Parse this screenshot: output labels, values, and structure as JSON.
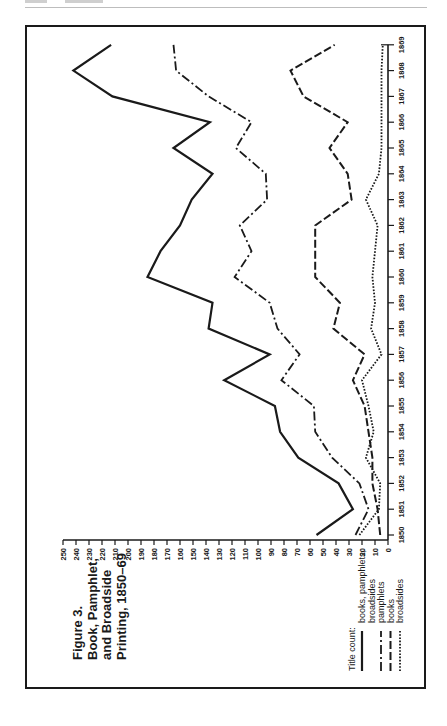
{
  "page": {
    "header_left": "",
    "header_right": ""
  },
  "figure": {
    "title_lines": [
      "Figure 3.",
      "Book, Pamphlet,",
      "and Broadside",
      "Printing, 1850–69"
    ],
    "legend_title": "Title count:",
    "legend": [
      {
        "style": "solid",
        "label_lines": [
          "books, pamphlets,",
          "broadsides"
        ]
      },
      {
        "style": "dashdot",
        "label_lines": [
          "pamphlets"
        ]
      },
      {
        "style": "dash",
        "label_lines": [
          "books"
        ]
      },
      {
        "style": "dotted",
        "label_lines": [
          "broadsides"
        ]
      }
    ]
  },
  "chart_data": {
    "type": "line",
    "xlabel": "",
    "ylabel": "Title count",
    "orientation": "rotated 90° counter-clockwise (years along right edge bottom→top, values along bottom edge right→left)",
    "x": [
      1850,
      1851,
      1852,
      1853,
      1854,
      1855,
      1856,
      1857,
      1858,
      1859,
      1860,
      1861,
      1862,
      1863,
      1864,
      1865,
      1866,
      1867,
      1868,
      1869
    ],
    "x_tick_labels": [
      "1850",
      "1851",
      "1852",
      "1853",
      "1854",
      "1855",
      "1856",
      "1857",
      "1858",
      "1859",
      "1860",
      "1861",
      "1862",
      "1863",
      "1864",
      "1865",
      "1866",
      "1867",
      "1868",
      "1869"
    ],
    "y_ticks": [
      0,
      10,
      20,
      30,
      40,
      50,
      60,
      70,
      80,
      90,
      100,
      110,
      120,
      130,
      140,
      150,
      160,
      170,
      180,
      190,
      200,
      210,
      220,
      230,
      240,
      250
    ],
    "ylim": [
      0,
      250
    ],
    "grid": false,
    "legend_position": "lower left (rotated)",
    "series": [
      {
        "name": "books, pamphlets, broadsides",
        "style": "solid",
        "values": [
          55,
          27,
          38,
          69,
          83,
          87,
          126,
          91,
          138,
          135,
          185,
          175,
          160,
          151,
          135,
          165,
          137,
          212,
          242,
          213
        ]
      },
      {
        "name": "pamphlets",
        "style": "dashdot",
        "values": [
          25,
          15,
          22,
          43,
          56,
          57,
          82,
          68,
          85,
          91,
          118,
          105,
          114,
          93,
          94,
          117,
          105,
          138,
          163,
          165
        ]
      },
      {
        "name": "books",
        "style": "dash",
        "values": [
          6,
          8,
          12,
          12,
          15,
          18,
          27,
          18,
          42,
          37,
          56,
          56,
          56,
          28,
          31,
          45,
          31,
          65,
          75,
          41
        ]
      },
      {
        "name": "broadsides",
        "style": "dotted",
        "values": [
          22,
          7,
          6,
          17,
          11,
          15,
          20,
          5,
          13,
          10,
          12,
          10,
          8,
          17,
          7,
          5,
          5,
          5,
          5,
          4
        ]
      }
    ]
  }
}
